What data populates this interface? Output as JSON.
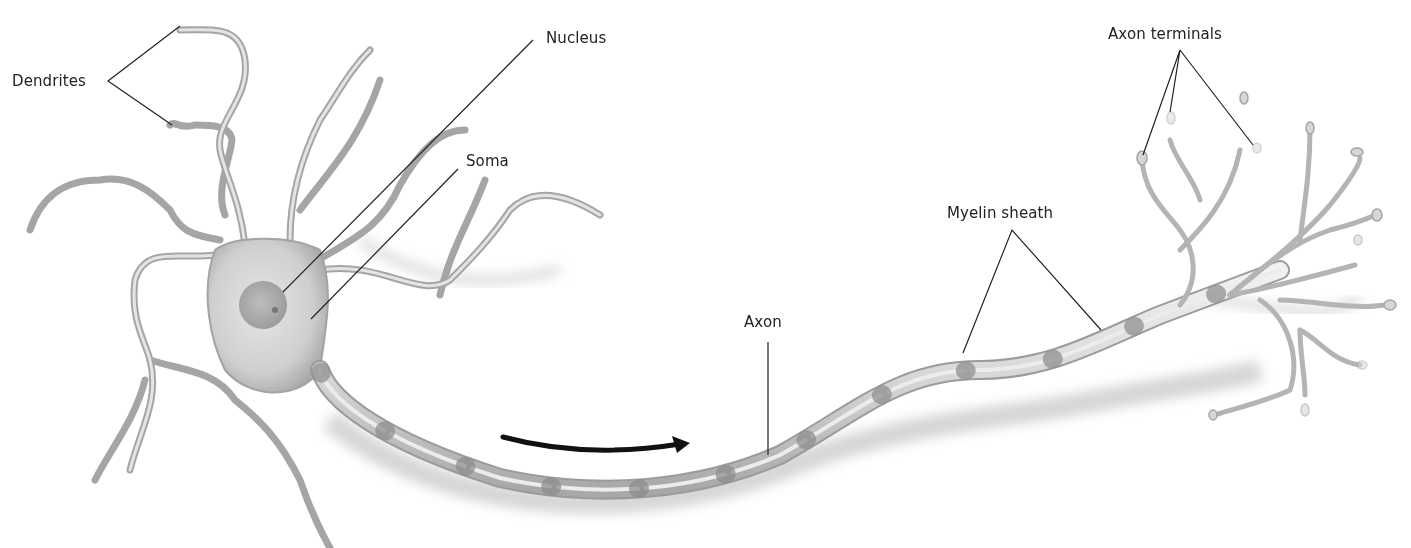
{
  "diagram": {
    "labels": {
      "dendrites": "Dendrites",
      "nucleus": "Nucleus",
      "soma": "Soma",
      "axon": "Axon",
      "myelin_sheath": "Myelin sheath",
      "axon_terminals": "Axon terminals"
    },
    "arrow": {
      "meaning": "direction of signal",
      "icon": "arrow-right-icon"
    },
    "colors": {
      "background": "#ffffff",
      "neuron_fill": "#d9d9d9",
      "neuron_edge": "#9a9a9a",
      "nucleus_fill": "#a8a8a8",
      "leader_line": "#222222",
      "arrow": "#111111"
    }
  }
}
